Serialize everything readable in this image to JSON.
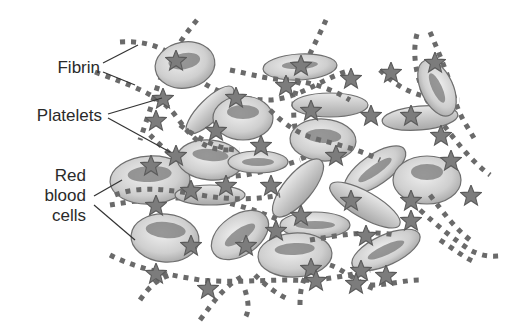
{
  "diagram": {
    "labels": {
      "fibrin": "Fibrin",
      "platelets": "Platelets",
      "rbc_line1": "Red",
      "rbc_line2": "blood",
      "rbc_line3": "cells"
    },
    "components": [
      {
        "name": "Fibrin",
        "depiction": "dotted strands",
        "color": "#6a6a6a"
      },
      {
        "name": "Platelets",
        "depiction": "star shapes",
        "color": "#7c7c7c"
      },
      {
        "name": "Red blood cells",
        "depiction": "biconcave discs (ellipses with dark centers)",
        "color": "#cfcfcf"
      }
    ],
    "colors": {
      "background": "#ffffff",
      "text": "#2a2a2a",
      "cell_light": "#e6e6e6",
      "cell_dark": "#9a9a9a"
    }
  }
}
